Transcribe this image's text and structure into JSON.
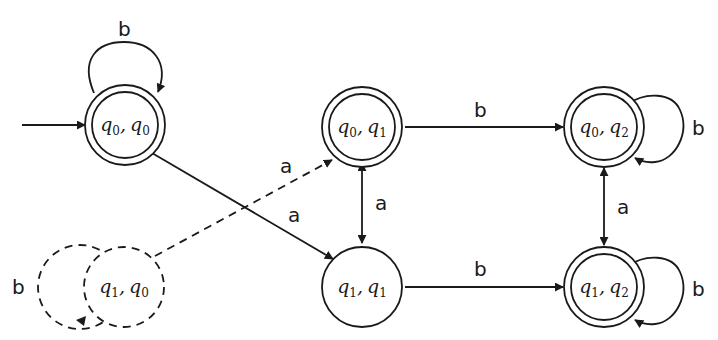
{
  "diagram": {
    "type": "state-machine (product DFA)",
    "colors": {
      "stroke": "#1a1a1a",
      "background": "#ffffff"
    },
    "states": [
      {
        "id": "q0q0",
        "label_a": "q",
        "sub_a": "0",
        "label_b": "q",
        "sub_b": "0",
        "accepting": true,
        "initial": true,
        "unreachable": false
      },
      {
        "id": "q0q1",
        "label_a": "q",
        "sub_a": "0",
        "label_b": "q",
        "sub_b": "1",
        "accepting": true,
        "initial": false,
        "unreachable": false
      },
      {
        "id": "q0q2",
        "label_a": "q",
        "sub_a": "0",
        "label_b": "q",
        "sub_b": "2",
        "accepting": true,
        "initial": false,
        "unreachable": false
      },
      {
        "id": "q1q0",
        "label_a": "q",
        "sub_a": "1",
        "label_b": "q",
        "sub_b": "0",
        "accepting": false,
        "initial": false,
        "unreachable": true
      },
      {
        "id": "q1q1",
        "label_a": "q",
        "sub_a": "1",
        "label_b": "q",
        "sub_b": "1",
        "accepting": false,
        "initial": false,
        "unreachable": false
      },
      {
        "id": "q1q2",
        "label_a": "q",
        "sub_a": "1",
        "label_b": "q",
        "sub_b": "2",
        "accepting": true,
        "initial": false,
        "unreachable": false
      }
    ],
    "transitions": [
      {
        "from": "q0q0",
        "to": "q0q0",
        "symbol": "b",
        "style": "solid"
      },
      {
        "from": "q0q0",
        "to": "q1q1",
        "symbol": "a",
        "style": "solid"
      },
      {
        "from": "q1q0",
        "to": "q0q1",
        "symbol": "a",
        "style": "dashed"
      },
      {
        "from": "q1q0",
        "to": "q1q0",
        "symbol": "b",
        "style": "dashed"
      },
      {
        "from": "q0q1",
        "to": "q1q1",
        "symbol": "a",
        "style": "solid",
        "bidirectional": true
      },
      {
        "from": "q0q1",
        "to": "q0q2",
        "symbol": "b",
        "style": "solid"
      },
      {
        "from": "q1q1",
        "to": "q1q2",
        "symbol": "b",
        "style": "solid"
      },
      {
        "from": "q0q2",
        "to": "q1q2",
        "symbol": "a",
        "style": "solid",
        "bidirectional": true
      },
      {
        "from": "q0q2",
        "to": "q0q2",
        "symbol": "b",
        "style": "solid"
      },
      {
        "from": "q1q2",
        "to": "q1q2",
        "symbol": "b",
        "style": "solid"
      }
    ],
    "comma": ","
  }
}
